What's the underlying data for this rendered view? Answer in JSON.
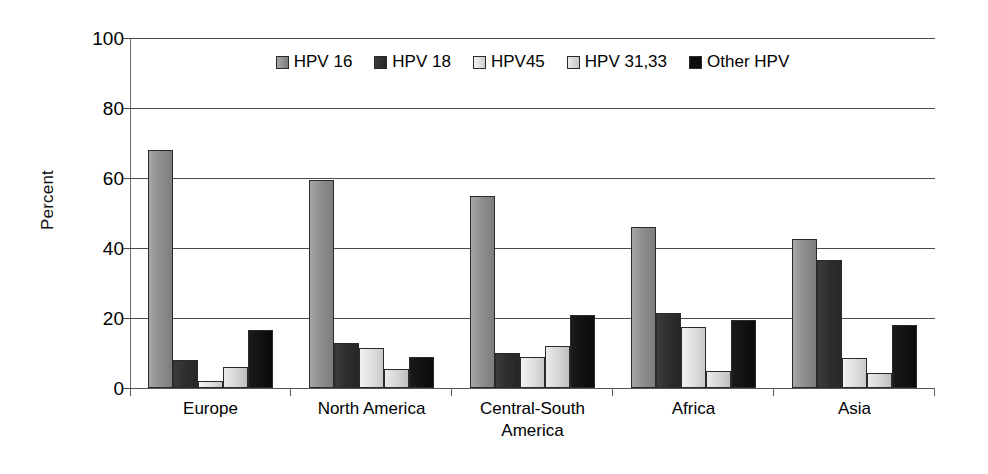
{
  "chart_data": {
    "type": "bar",
    "title": "",
    "xlabel": "",
    "ylabel": "Percent",
    "ylim": [
      0,
      100
    ],
    "yticks": [
      0,
      20,
      40,
      60,
      80,
      100
    ],
    "ytick_labels": [
      "0",
      "20",
      "40",
      "60",
      "80",
      "100"
    ],
    "grid": true,
    "legend_position": "top-center",
    "categories": [
      "Europe",
      "North America",
      "Central-South America",
      "Asia",
      "Africa"
    ],
    "category_lines": [
      [
        "Europe"
      ],
      [
        "North America"
      ],
      [
        "Central-South",
        "America"
      ],
      [
        "Africa"
      ],
      [
        "Asia"
      ]
    ],
    "series": [
      {
        "name": "HPV 16",
        "color": "#8f8f8f",
        "values": [
          68.0,
          59.5,
          55.0,
          46.0,
          42.5
        ]
      },
      {
        "name": "HPV 18",
        "color": "#2e2e2e",
        "values": [
          8.0,
          12.8,
          10.0,
          21.3,
          36.5
        ]
      },
      {
        "name": "HPV45",
        "color": "#dedede",
        "values": [
          2.0,
          11.5,
          9.0,
          17.3,
          8.5
        ]
      },
      {
        "name": "HPV  31,33",
        "color": "#d5d5d5",
        "values": [
          6.0,
          5.5,
          12.0,
          5.0,
          4.3
        ]
      },
      {
        "name": "Other HPV",
        "color": "#0d0d0d",
        "values": [
          16.5,
          8.8,
          21.0,
          19.5,
          18.0
        ]
      }
    ]
  },
  "legend": {
    "items": [
      {
        "label": "HPV 16"
      },
      {
        "label": "HPV 18"
      },
      {
        "label": "HPV45"
      },
      {
        "label": "HPV  31,33"
      },
      {
        "label": "Other HPV"
      }
    ]
  },
  "axis": {
    "y_title": "Percent"
  }
}
